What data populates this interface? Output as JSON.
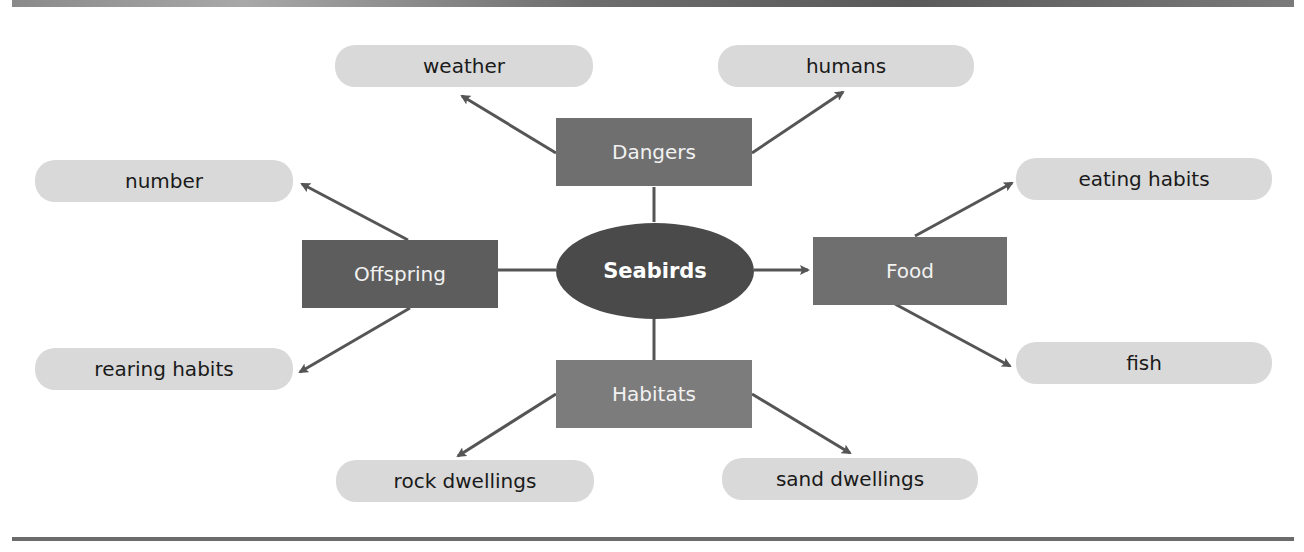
{
  "diagram": {
    "center": {
      "label": "Seabirds"
    },
    "categories": {
      "dangers": {
        "label": "Dangers"
      },
      "offspring": {
        "label": "Offspring"
      },
      "food": {
        "label": "Food"
      },
      "habitats": {
        "label": "Habitats"
      }
    },
    "leaves": {
      "weather": {
        "label": "weather"
      },
      "humans": {
        "label": "humans"
      },
      "number": {
        "label": "number"
      },
      "rearing_habits": {
        "label": "rearing habits"
      },
      "eating_habits": {
        "label": "eating habits"
      },
      "fish": {
        "label": "fish"
      },
      "rock_dwellings": {
        "label": "rock dwellings"
      },
      "sand_dwellings": {
        "label": "sand dwellings"
      }
    },
    "colors": {
      "center_fill": "#4a4a4a",
      "category_fill": "#6f6f6f",
      "leaf_fill": "#d9d9d9",
      "connector": "#555555"
    }
  }
}
